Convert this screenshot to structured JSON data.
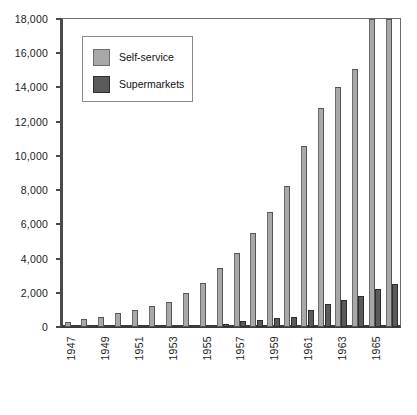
{
  "chart_data": {
    "type": "bar",
    "title": "",
    "subtitle": "",
    "xlabel": "",
    "ylabel": "",
    "ylim": [
      0,
      18000
    ],
    "y_ticks": [
      0,
      2000,
      4000,
      6000,
      8000,
      10000,
      12000,
      14000,
      16000,
      18000
    ],
    "y_tick_labels": [
      "0",
      "2,000",
      "4,000",
      "6,000",
      "8,000",
      "10,000",
      "12,000",
      "14,000",
      "16,000",
      "18,000"
    ],
    "grid": false,
    "legend_position": "upper-left-inside",
    "categories": [
      1947,
      1948,
      1949,
      1950,
      1951,
      1952,
      1953,
      1954,
      1955,
      1956,
      1957,
      1958,
      1959,
      1960,
      1961,
      1962,
      1963,
      1964,
      1965,
      1966
    ],
    "x_tick_labels": [
      "1947",
      "1949",
      "1951",
      "1953",
      "1955",
      "1957",
      "1959",
      "1961",
      "1963",
      "1965"
    ],
    "x_tick_indices": [
      0,
      2,
      4,
      6,
      8,
      10,
      12,
      14,
      16,
      18
    ],
    "series": [
      {
        "name": "Self-service",
        "color": "#a8a8a8",
        "values": [
          280,
          450,
          600,
          800,
          1000,
          1250,
          1450,
          2000,
          2550,
          3450,
          4300,
          5500,
          6750,
          8250,
          10600,
          12800,
          14000,
          15100,
          18000,
          18000
        ]
      },
      {
        "name": "Supermarkets",
        "color": "#5a5a5a",
        "values": [
          0,
          0,
          0,
          0,
          0,
          0,
          0,
          0,
          0,
          180,
          350,
          400,
          520,
          600,
          1000,
          1350,
          1600,
          1800,
          2250,
          2500
        ]
      }
    ]
  },
  "legend": {
    "items": [
      {
        "label": "Self-service",
        "color": "#a8a8a8"
      },
      {
        "label": "Supermarkets",
        "color": "#5a5a5a"
      }
    ]
  }
}
